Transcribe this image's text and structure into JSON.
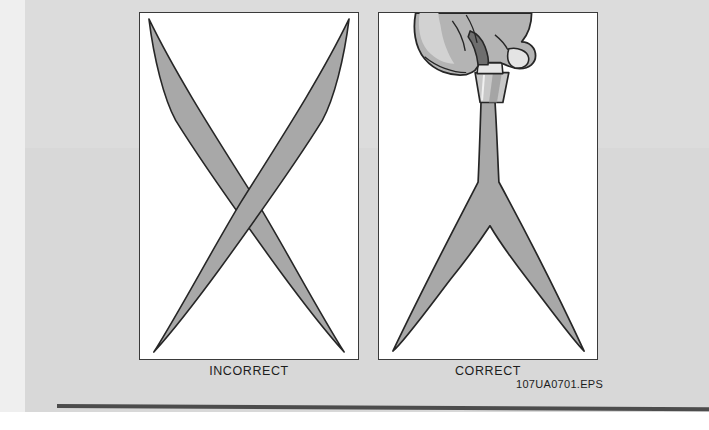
{
  "figure": {
    "id_label": "107UA0701.EPS",
    "panels": [
      {
        "key": "incorrect",
        "caption": "INCORRECT",
        "illustration": "two-tapered-bands-crossing-in-x-shape",
        "description": "Two curved tapered strands crossing each other in an X, tips reaching all four corners of the panel"
      },
      {
        "key": "correct",
        "caption": "CORRECT",
        "illustration": "hand-gripping-handle-with-y-shaped-split",
        "description": "A hand grips a tool handle at the top; a single band descends and splits into a Y, the two legs sweeping down to the bottom corners"
      }
    ]
  },
  "colors": {
    "page_background": "#dcdcdc",
    "page_background_lower": "#d8d8d8",
    "page_edge": "#efefef",
    "panel_fill": "#ffffff",
    "panel_border": "#3a3a3a",
    "shape_fill": "#a8a8a8",
    "shape_outline": "#262626",
    "skin_fill": "#b4b4b4",
    "skin_highlight": "#d2d2d2",
    "handle_fill": "#c8c8c8",
    "handle_shadow": "#6e6e6e",
    "rule": "#4c4c4c",
    "text": "#1d1d1d"
  }
}
